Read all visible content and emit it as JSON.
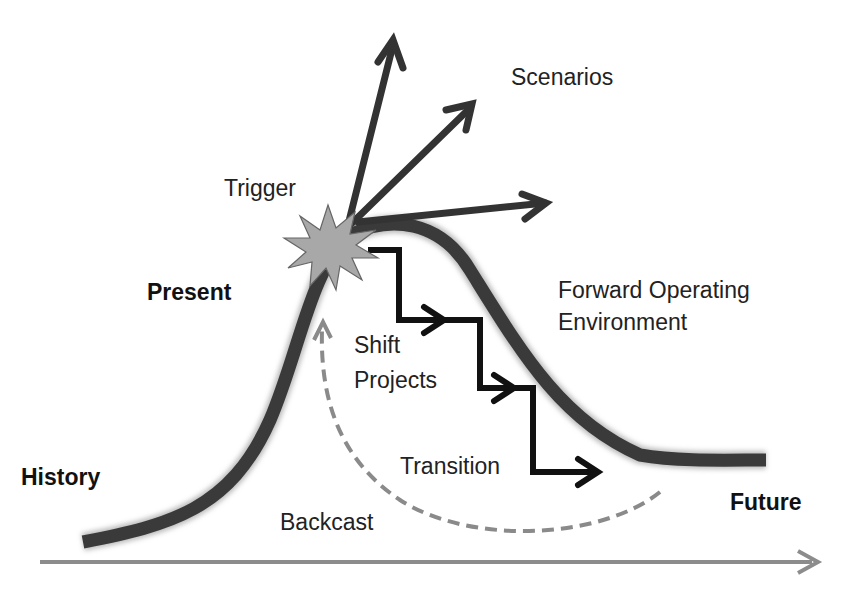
{
  "labels": {
    "scenarios": "Scenarios",
    "trigger": "Trigger",
    "present": "Present",
    "forward_line1": "Forward Operating",
    "forward_line2": "Environment",
    "shift": "Shift",
    "projects": "Projects",
    "transition": "Transition",
    "history": "History",
    "backcast": "Backcast",
    "future": "Future"
  },
  "colors": {
    "curve": "#3a3a3a",
    "staircase": "#111111",
    "starburst_fill": "#a8a8a8",
    "backcast_dash": "#8a8a8a",
    "time_axis": "#8c8c8c"
  }
}
